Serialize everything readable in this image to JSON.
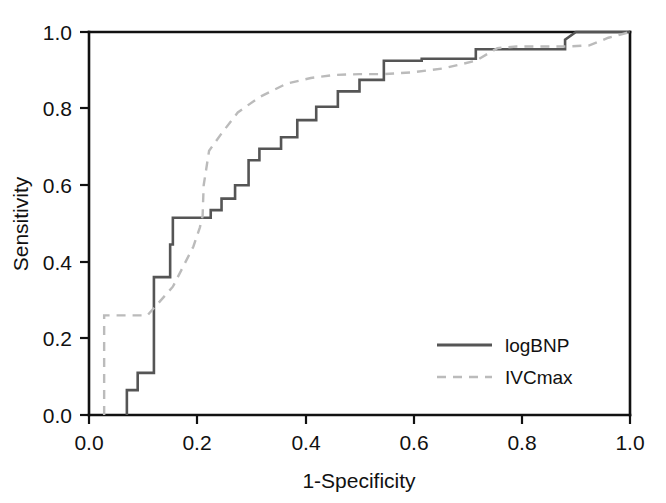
{
  "chart_data": {
    "type": "line",
    "title": "",
    "subtitle": "",
    "xlabel": "1-Specificity",
    "ylabel": "Sensitivity",
    "xlim": [
      0.0,
      1.0
    ],
    "ylim": [
      0.0,
      1.0
    ],
    "grid": false,
    "legend_position": "bottom-right",
    "xticks": [
      "0.0",
      "0.2",
      "0.4",
      "0.6",
      "0.8",
      "1.0"
    ],
    "xtick_values": [
      0.0,
      0.2,
      0.4,
      0.6,
      0.8,
      1.0
    ],
    "yticks": [
      "0.0",
      "0.2",
      "0.4",
      "0.6",
      "0.8",
      "1.0"
    ],
    "ytick_values": [
      0.0,
      0.2,
      0.4,
      0.6,
      0.8,
      1.0
    ],
    "series": [
      {
        "name": "logBNP",
        "style": "solid",
        "color": "#555555",
        "x": [
          0.07,
          0.07,
          0.09,
          0.09,
          0.12,
          0.12,
          0.15,
          0.15,
          0.155,
          0.155,
          0.225,
          0.225,
          0.245,
          0.245,
          0.27,
          0.27,
          0.295,
          0.295,
          0.315,
          0.315,
          0.355,
          0.355,
          0.385,
          0.385,
          0.42,
          0.42,
          0.46,
          0.46,
          0.5,
          0.5,
          0.545,
          0.545,
          0.615,
          0.615,
          0.715,
          0.715,
          0.88,
          0.88,
          0.9,
          1.0
        ],
        "y": [
          0.0,
          0.065,
          0.065,
          0.11,
          0.11,
          0.36,
          0.36,
          0.445,
          0.445,
          0.515,
          0.515,
          0.535,
          0.535,
          0.565,
          0.565,
          0.6,
          0.6,
          0.665,
          0.665,
          0.695,
          0.695,
          0.725,
          0.725,
          0.77,
          0.77,
          0.805,
          0.805,
          0.845,
          0.845,
          0.875,
          0.875,
          0.925,
          0.925,
          0.93,
          0.93,
          0.955,
          0.955,
          0.98,
          1.0,
          1.0
        ]
      },
      {
        "name": "IVCmax",
        "style": "dashed",
        "color": "#bbbbbb",
        "x": [
          0.028,
          0.028,
          0.108,
          0.155,
          0.193,
          0.205,
          0.21,
          0.212,
          0.222,
          0.245,
          0.275,
          0.315,
          0.365,
          0.41,
          0.455,
          0.5,
          0.545,
          0.6,
          0.655,
          0.715,
          0.755,
          0.79,
          0.835,
          0.88,
          0.925,
          0.96,
          1.0
        ],
        "y": [
          0.0,
          0.26,
          0.26,
          0.335,
          0.44,
          0.49,
          0.52,
          0.6,
          0.69,
          0.735,
          0.79,
          0.83,
          0.865,
          0.88,
          0.888,
          0.89,
          0.89,
          0.895,
          0.905,
          0.925,
          0.958,
          0.962,
          0.962,
          0.962,
          0.965,
          0.985,
          1.0
        ]
      }
    ],
    "annotations": []
  },
  "legend": {
    "entries": [
      {
        "label": "logBNP",
        "style": "solid",
        "color": "#555555"
      },
      {
        "label": "IVCmax",
        "style": "dashed",
        "color": "#bbbbbb"
      }
    ]
  },
  "axes": {
    "x_title": "1-Specificity",
    "y_title": "Sensitivity",
    "x_ticks": [
      "0.0",
      "0.2",
      "0.4",
      "0.6",
      "0.8",
      "1.0"
    ],
    "y_ticks": [
      "1.0",
      "0.8",
      "0.6",
      "0.4",
      "0.2",
      "0.0"
    ],
    "axis_color": "#111111"
  },
  "icons": {
    "solid_line": "solid-line-swatch",
    "dashed_line": "dashed-line-swatch"
  }
}
